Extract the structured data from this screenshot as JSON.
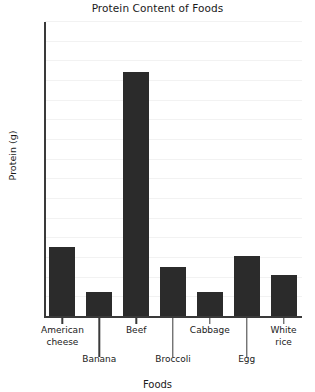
{
  "chart_data": {
    "type": "bar",
    "title": "Protein Content of Foods",
    "xlabel": "Foods",
    "ylabel": "Protein (g)",
    "categories": [
      "American cheese",
      "Banana",
      "Beef",
      "Broccoli",
      "Cabbage",
      "Egg",
      "White rice"
    ],
    "values": [
      7.0,
      2.4,
      24.8,
      5.0,
      2.4,
      6.1,
      4.2
    ],
    "ylim": [
      0,
      30
    ],
    "ytick_step": 2,
    "ytick_labels": [
      "30",
      "28",
      "26",
      "24",
      "22",
      "20",
      "18",
      "16",
      "14",
      "12",
      "10",
      "8",
      "6",
      "4",
      "2",
      "0"
    ],
    "grid": true,
    "legend": "none",
    "bar_color": "#2b2b2b",
    "axis_color": "#3a3a3a",
    "grid_color": "#f2f2f2",
    "background": "#ffffff",
    "xtick_label_rows": [
      {
        "text": "American\ncheese",
        "row": "top"
      },
      {
        "text": "Banana",
        "row": "bottom"
      },
      {
        "text": "Beef",
        "row": "top"
      },
      {
        "text": "Broccoli",
        "row": "bottom"
      },
      {
        "text": "Cabbage",
        "row": "top"
      },
      {
        "text": "Egg",
        "row": "bottom"
      },
      {
        "text": "White\nrice",
        "row": "top"
      }
    ]
  }
}
